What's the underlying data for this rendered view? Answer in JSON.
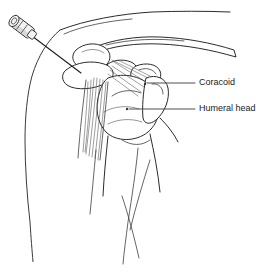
{
  "figure": {
    "background_color": "#ffffff",
    "line_color": "#2b2b2b",
    "width": 264,
    "height": 277
  },
  "labels": [
    {
      "id": "coracoid",
      "text": "Coracoid",
      "text_x": 197,
      "text_y": 83,
      "leader_start_x": 195,
      "leader_start_y": 83,
      "leader_end_x": 147,
      "leader_end_y": 83,
      "point_x": 145,
      "point_y": 84
    },
    {
      "id": "humeral-head",
      "text": "Humeral head",
      "text_x": 197,
      "text_y": 109,
      "leader_start_x": 195,
      "leader_start_y": 109,
      "leader_end_x": 129,
      "leader_end_y": 109,
      "point_x": 127,
      "point_y": 109
    }
  ],
  "instrument": {
    "name": "needle-and-hub",
    "hub_center_x": 22,
    "hub_center_y": 27,
    "tip_x": 81,
    "tip_y": 73
  },
  "structures": [
    {
      "id": "clavicle",
      "name": "clavicle"
    },
    {
      "id": "acromion",
      "name": "acromion"
    },
    {
      "id": "coracoid-process",
      "name": "coracoid process"
    },
    {
      "id": "humeral-head-bone",
      "name": "humeral head"
    },
    {
      "id": "greater-tuberosity",
      "name": "greater tuberosity"
    },
    {
      "id": "humeral-shaft",
      "name": "humeral shaft"
    },
    {
      "id": "conjoint-tendon",
      "name": "conjoint tendon striations"
    },
    {
      "id": "torso-outline",
      "name": "torso and deltoid outline"
    },
    {
      "id": "arm-outline",
      "name": "arm outline"
    }
  ]
}
